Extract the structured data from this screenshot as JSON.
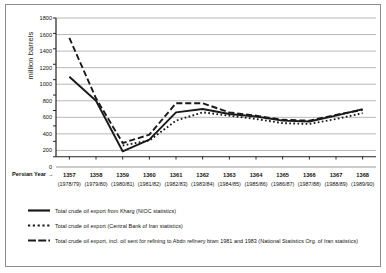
{
  "chart_data": {
    "type": "line",
    "title": "",
    "xlabel": "Persian Year →",
    "ylabel": "million barrels",
    "ylim": [
      0,
      1800
    ],
    "ytick_step": 200,
    "yticks": [
      0,
      200,
      400,
      600,
      800,
      1000,
      1200,
      1400,
      1600,
      1800
    ],
    "grid": "horizontal",
    "legend_position": "below",
    "categories": [
      "1357",
      "1358",
      "1359",
      "1360",
      "1361",
      "1362",
      "1363",
      "1364",
      "1365",
      "1366",
      "1367",
      "1368"
    ],
    "categories_gregorian": [
      "(1978/79)",
      "(1979/80)",
      "(1980/81)",
      "(1981/82)",
      "(1982/83)",
      "(1983/84)",
      "(1984/85)",
      "(1985/86)",
      "(1986/87)",
      "(1987/88)",
      "(1988/89)",
      "(1989/90)"
    ],
    "series": [
      {
        "name": "Total crude oil export from Kharg (NIOC statistics)",
        "style": "solid",
        "color": "#1a1a1a",
        "values": [
          1090,
          800,
          190,
          330,
          660,
          700,
          640,
          610,
          560,
          550,
          620,
          700
        ]
      },
      {
        "name": "Total crude oil export (Central Bank of Iran statistics)",
        "style": "dotted",
        "color": "#1a1a1a",
        "values": [
          null,
          null,
          260,
          320,
          560,
          660,
          620,
          580,
          530,
          520,
          580,
          650
        ]
      },
      {
        "name": "Total crude oil export, incl. oil sent for refining to Abdn refinery btwn 1981 and 1983 (National Statistics Org. of Iran statistics)",
        "style": "dashed",
        "color": "#1a1a1a",
        "values": [
          1560,
          830,
          290,
          390,
          770,
          770,
          660,
          620,
          570,
          560,
          630,
          690
        ]
      }
    ]
  },
  "axis": {
    "y_title": "million barrels",
    "x_caption": "Persian Year →"
  },
  "colors": {
    "frame": "#8c8c8c",
    "grid": "#9a9a9a",
    "axis": "#222222",
    "ink": "#1a1a1a",
    "background": "#ffffff"
  },
  "legend": {
    "items": [
      {
        "label": "Total crude oil export from Kharg (NIOC statistics)",
        "style": "solid",
        "swatch_name": "legend-swatch-solid"
      },
      {
        "label": "Total crude oil export (Central Bank of Iran statistics)",
        "style": "dotted",
        "swatch_name": "legend-swatch-dotted"
      },
      {
        "label": "Total crude oil export, incl. oil sent for refining to Abdn refinery btwn 1981 and 1983 (National Statistics Org. of Iran statistics)",
        "style": "dashed",
        "swatch_name": "legend-swatch-dashed"
      }
    ]
  }
}
